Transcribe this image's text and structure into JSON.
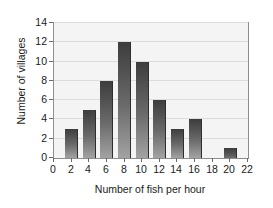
{
  "chart_data": {
    "type": "bar",
    "title": "",
    "xlabel": "Number of fish per hour",
    "ylabel": "Number of villages",
    "categories": [
      2,
      4,
      6,
      8,
      10,
      12,
      14,
      16,
      18,
      20
    ],
    "values": [
      3,
      5,
      8,
      12,
      10,
      6,
      3,
      4,
      0,
      1
    ],
    "xlim": [
      0,
      22
    ],
    "ylim": [
      0,
      14
    ],
    "xticks": [
      0,
      2,
      4,
      6,
      8,
      10,
      12,
      14,
      16,
      18,
      20,
      22
    ],
    "yticks": [
      0,
      2,
      4,
      6,
      8,
      10,
      12,
      14
    ],
    "xtick_labels": [
      "0",
      "2",
      "4",
      "6",
      "8",
      "10",
      "12",
      "14",
      "16",
      "18",
      "20",
      "22"
    ],
    "ytick_labels": [
      "0",
      "2",
      "4",
      "6",
      "8",
      "10",
      "12",
      "14"
    ],
    "grid": "horizontal",
    "legend": "none",
    "bar_color": "#555555",
    "plot_background": "#f4f4f4",
    "frame_color": "#8e8e8e",
    "gridline_color": "#dcdcdc"
  }
}
